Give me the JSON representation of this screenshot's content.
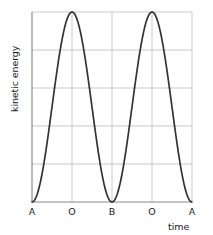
{
  "chart_data": {
    "type": "line",
    "title": "",
    "subtitle": "",
    "xlabel": "time",
    "ylabel": "kinetic energy",
    "grid": true,
    "legend": null,
    "xlim": [
      0,
      4
    ],
    "ylim": [
      0,
      1
    ],
    "x_tick_labels": [
      "A",
      "O",
      "B",
      "O",
      "A"
    ],
    "x_tick_values": [
      0,
      1,
      2,
      3,
      4
    ],
    "y_tick_labels": [
      "",
      "",
      "",
      "",
      "",
      ""
    ],
    "y_gridlines": [
      0,
      0.2,
      0.4,
      0.6,
      0.8,
      1.0
    ],
    "series": [
      {
        "name": "kinetic energy",
        "color": "#333333",
        "description": "sin-squared oscillation: zero at A and B, maximum at O",
        "x": [
          0.0,
          0.1,
          0.2,
          0.3,
          0.4,
          0.5,
          0.6,
          0.7,
          0.8,
          0.9,
          1.0,
          1.1,
          1.2,
          1.3,
          1.4,
          1.5,
          1.6,
          1.7,
          1.8,
          1.9,
          2.0,
          2.1,
          2.2,
          2.3,
          2.4,
          2.5,
          2.6,
          2.7,
          2.8,
          2.9,
          3.0,
          3.1,
          3.2,
          3.3,
          3.4,
          3.5,
          3.6,
          3.7,
          3.8,
          3.9,
          4.0
        ],
        "y": [
          0.0,
          0.024,
          0.095,
          0.206,
          0.345,
          0.5,
          0.655,
          0.794,
          0.905,
          0.976,
          1.0,
          0.976,
          0.905,
          0.794,
          0.655,
          0.5,
          0.345,
          0.206,
          0.095,
          0.024,
          0.0,
          0.024,
          0.095,
          0.206,
          0.345,
          0.5,
          0.655,
          0.794,
          0.905,
          0.976,
          1.0,
          0.976,
          0.905,
          0.794,
          0.655,
          0.5,
          0.345,
          0.206,
          0.095,
          0.024,
          0.0
        ]
      }
    ],
    "annotations": {
      "zero_points": [
        "A",
        "B",
        "A"
      ],
      "maximum_points": [
        "O",
        "O"
      ]
    }
  },
  "axis": {
    "y_title": "kinetic energy",
    "x_title": "time",
    "ticks": [
      {
        "label": "A",
        "left": 22
      },
      {
        "label": "O",
        "left": 62
      },
      {
        "label": "B",
        "left": 102
      },
      {
        "label": "O",
        "left": 142
      },
      {
        "label": "A",
        "left": 182
      }
    ]
  },
  "style": {
    "grid_color": "#c9c9c9",
    "axis_color": "#8a8a8a",
    "curve_color": "#333333",
    "text_color": "#1a1a1a",
    "background": "#ffffff"
  }
}
